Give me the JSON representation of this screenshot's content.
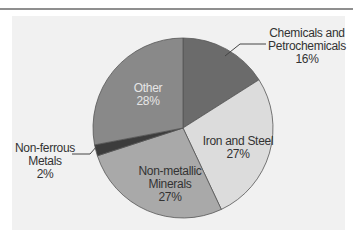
{
  "chart_data": {
    "type": "pie",
    "title": "",
    "categories": [
      "Chemicals and Petrochemicals",
      "Iron and Steel",
      "Non-metallic Minerals",
      "Non-ferrous Metals",
      "Other"
    ],
    "values": [
      16,
      27,
      27,
      2,
      28
    ],
    "unit": "%",
    "start_angle": "12 o'clock",
    "direction": "clockwise",
    "colors": [
      "#6b6b6b",
      "#dcdcdc",
      "#a9a9a9",
      "#3c3c3c",
      "#898989"
    ],
    "labels": [
      {
        "lines": [
          "Chemicals and",
          "Petrochemicals"
        ],
        "value": "16%",
        "position": "outside-right",
        "leader_line": true
      },
      {
        "lines": [
          "Iron and Steel"
        ],
        "value": "27%",
        "position": "inside"
      },
      {
        "lines": [
          "Non-metallic",
          "Minerals"
        ],
        "value": "27%",
        "position": "inside"
      },
      {
        "lines": [
          "Non-ferrous",
          "Metals"
        ],
        "value": "2%",
        "position": "outside-left",
        "leader_line": true
      },
      {
        "lines": [
          "Other"
        ],
        "value": "28%",
        "position": "inside"
      }
    ],
    "legend": "none",
    "grid": false,
    "background": "#f1f1f1"
  }
}
